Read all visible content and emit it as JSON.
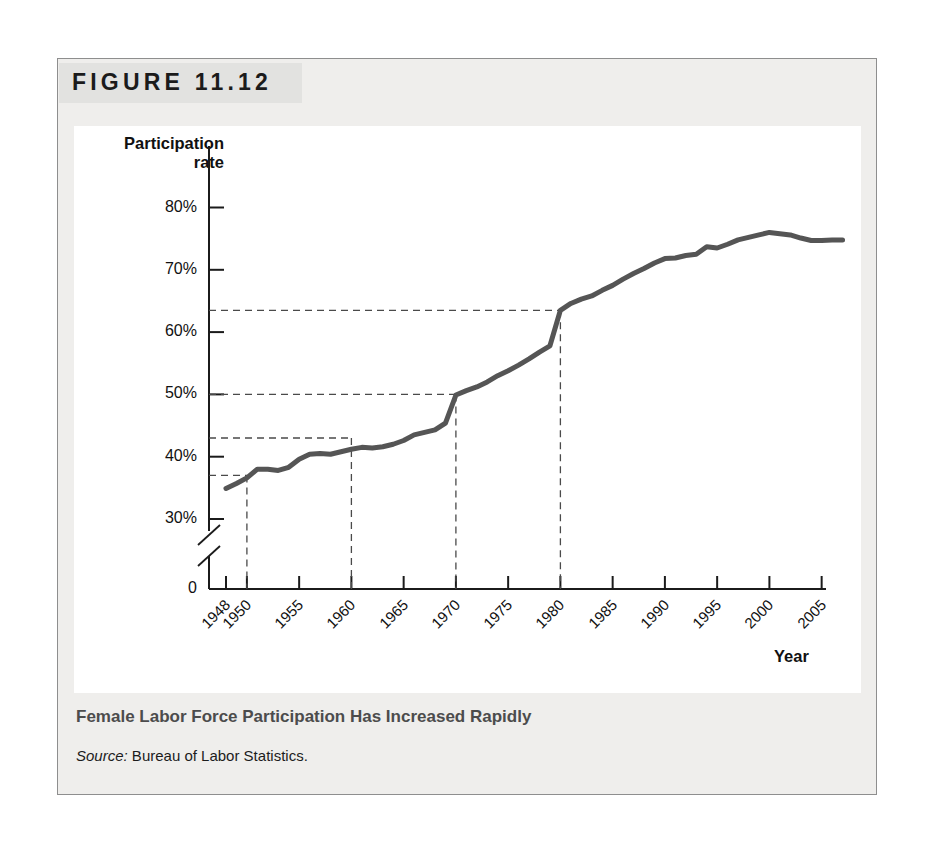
{
  "figure": {
    "number_label": "FIGURE 11.12",
    "caption": "Female Labor Force Participation Has Increased Rapidly",
    "source_label": "Source:",
    "source_text": " Bureau of Labor Statistics."
  },
  "colors": {
    "line": "#555555",
    "axis": "#1b1b1b",
    "dashed_guide": "#4a4a4a",
    "panel_background": "#ffffff",
    "figure_background": "#efeeec",
    "figure_border": "#8e8e8e",
    "caption_text": "#4c4c4c",
    "band_background": "#e2e2e0"
  },
  "chart_data": {
    "type": "line",
    "title": "Female Labor Force Participation Has Increased Rapidly",
    "xlabel": "Year",
    "ylabel": "Participation rate",
    "ylim": [
      0,
      84
    ],
    "y_axis_break": true,
    "y_axis_break_between": [
      0,
      28
    ],
    "xlim": [
      1948,
      2007
    ],
    "grid": false,
    "legend": null,
    "y_tick_labels": [
      "80%",
      "70%",
      "60%",
      "50%",
      "40%",
      "30%",
      "0"
    ],
    "y_tick_values": [
      80,
      70,
      60,
      50,
      40,
      30,
      0
    ],
    "x_tick_labels": [
      "1948",
      "1950",
      "1955",
      "1960",
      "1965",
      "1970",
      "1975",
      "1980",
      "1985",
      "1990",
      "1995",
      "2000",
      "2005"
    ],
    "x_tick_values": [
      1948,
      1950,
      1955,
      1960,
      1965,
      1970,
      1975,
      1980,
      1985,
      1990,
      1995,
      2000,
      2005
    ],
    "annotations": [
      {
        "name": "guide-1950",
        "year": 1950,
        "value": 37.0,
        "style": "dashed-crosshair"
      },
      {
        "name": "guide-1960",
        "year": 1960,
        "value": 43.0,
        "style": "dashed-crosshair"
      },
      {
        "name": "guide-1970",
        "year": 1970,
        "value": 50.0,
        "style": "dashed-crosshair"
      },
      {
        "name": "guide-1980",
        "year": 1980,
        "value": 63.5,
        "style": "dashed-crosshair"
      }
    ],
    "series": [
      {
        "name": "Female labor force participation rate",
        "x": [
          1948,
          1949,
          1950,
          1951,
          1952,
          1953,
          1954,
          1955,
          1956,
          1957,
          1958,
          1959,
          1960,
          1961,
          1962,
          1963,
          1964,
          1965,
          1966,
          1967,
          1968,
          1969,
          1970,
          1971,
          1972,
          1973,
          1974,
          1975,
          1976,
          1977,
          1978,
          1979,
          1980,
          1981,
          1982,
          1983,
          1984,
          1985,
          1986,
          1987,
          1988,
          1989,
          1990,
          1991,
          1992,
          1993,
          1994,
          1995,
          1996,
          1997,
          1998,
          1999,
          2000,
          2001,
          2002,
          2003,
          2004,
          2005,
          2006,
          2007
        ],
        "values": [
          34.9,
          35.7,
          36.6,
          38.0,
          38.0,
          37.8,
          38.3,
          39.6,
          40.4,
          40.5,
          40.4,
          40.8,
          41.2,
          41.5,
          41.4,
          41.6,
          42.0,
          42.6,
          43.5,
          43.9,
          44.3,
          45.4,
          49.9,
          50.6,
          51.2,
          52.0,
          53.0,
          53.8,
          54.7,
          55.7,
          56.8,
          57.8,
          63.5,
          64.6,
          65.3,
          65.8,
          66.7,
          67.5,
          68.5,
          69.4,
          70.2,
          71.1,
          71.8,
          71.9,
          72.3,
          72.5,
          73.7,
          73.5,
          74.1,
          74.8,
          75.2,
          75.6,
          76.0,
          75.8,
          75.6,
          75.1,
          74.7,
          74.7,
          74.8,
          74.8
        ]
      }
    ]
  }
}
